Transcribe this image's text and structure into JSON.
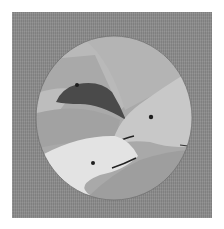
{
  "image": {
    "description": "Grayscale illustration of three dolphins seen through a circular porthole on a textured gray background",
    "width": 224,
    "height": 229,
    "colors": {
      "background": "#ffffff",
      "frame": "#8a8a8a",
      "circle_bg": "#a8a8a8",
      "upper_band": "#b5b5b5",
      "dark_dolphin": "#4a4a4a",
      "mid_dolphin": "#c6c6c6",
      "light_dolphin": "#e2e2e2",
      "lower_water": "#9c9c9c",
      "eye": "#1e1e1e"
    },
    "subjects": [
      {
        "name": "dark-dolphin",
        "position": "upper-left"
      },
      {
        "name": "gray-dolphin",
        "position": "right"
      },
      {
        "name": "white-dolphin",
        "position": "lower-left"
      }
    ]
  }
}
